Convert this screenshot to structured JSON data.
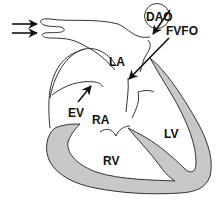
{
  "diagram": {
    "title": "",
    "labels": {
      "dao": "DAO",
      "fvfo": "FVFO",
      "la": "LA",
      "ev": "EV",
      "ra": "RA",
      "lv": "LV",
      "rv": "RV"
    },
    "colors": {
      "wall_fill": "#c8c8c8",
      "outline": "#333333",
      "background": "#ffffff"
    }
  }
}
